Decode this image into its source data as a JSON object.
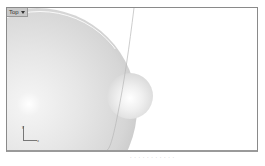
{
  "viewport": {
    "title": "Top",
    "menu_icon": "chevron-down-icon",
    "display_mode": "rendered"
  },
  "scene": {
    "objects": [
      {
        "type": "sphere",
        "label": "large-sphere"
      },
      {
        "type": "sphere",
        "label": "small-sphere"
      },
      {
        "type": "curve",
        "label": "curve-line"
      }
    ]
  },
  "axis_gizmo": {
    "x_label": "x",
    "y_label": "y"
  },
  "caption": {
    "text": "· · · · · · · · · · ·"
  },
  "colors": {
    "background": "#ffffff",
    "border": "#8a8a8a",
    "tab_background": "#c8c8c8",
    "sphere_shade": "#d6d6d6"
  }
}
